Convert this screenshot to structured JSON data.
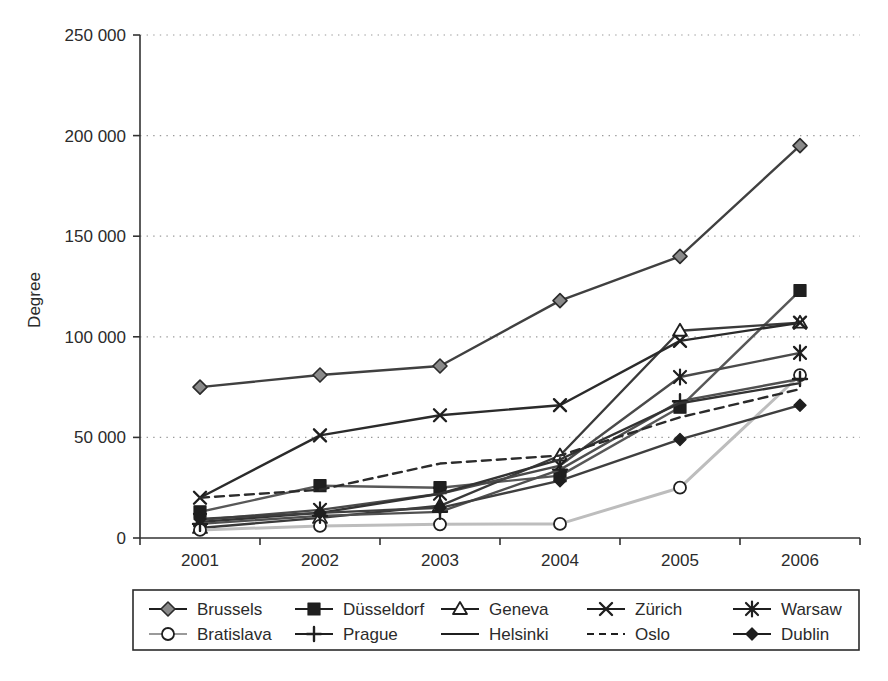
{
  "chart_data": {
    "type": "line",
    "title": "",
    "xlabel": "",
    "ylabel": "Degree",
    "categories": [
      "2001",
      "2002",
      "2003",
      "2004",
      "2005",
      "2006"
    ],
    "x": [
      2001,
      2002,
      2003,
      2004,
      2005,
      2006
    ],
    "ylim": [
      0,
      250000
    ],
    "ytick_values": [
      0,
      50000,
      100000,
      150000,
      200000,
      250000
    ],
    "ytick_labels": [
      "0",
      "50 000",
      "100 000",
      "150 000",
      "200 000",
      "250 000"
    ],
    "grid": "horizontal-dotted",
    "legend_position": "bottom",
    "series": [
      {
        "name": "Brussels",
        "marker": "diamond-filled-gray",
        "line_style": "solid",
        "color": "#404040",
        "values": [
          75000,
          81000,
          85500,
          118000,
          140000,
          195000
        ]
      },
      {
        "name": "Düsseldorf",
        "marker": "square-filled",
        "line_style": "solid",
        "color": "#585858",
        "values": [
          13000,
          26000,
          25000,
          31000,
          65000,
          123000
        ]
      },
      {
        "name": "Geneva",
        "marker": "triangle-open",
        "line_style": "solid",
        "color": "#3a3a3a",
        "values": [
          5000,
          10000,
          16000,
          41000,
          103000,
          107000
        ]
      },
      {
        "name": "Zürich",
        "marker": "cross-x",
        "line_style": "solid",
        "color": "#2b2b2b",
        "values": [
          20000,
          51000,
          61000,
          66000,
          98000,
          107000
        ]
      },
      {
        "name": "Warsaw",
        "marker": "asterisk",
        "line_style": "solid",
        "color": "#4a4a4a",
        "values": [
          9000,
          14000,
          22000,
          36000,
          80000,
          92000
        ]
      },
      {
        "name": "Bratislava",
        "marker": "circle-open",
        "line_style": "solid",
        "color": "#bdbdbd",
        "values": [
          4000,
          6000,
          6800,
          7000,
          25000,
          81000
        ]
      },
      {
        "name": "Prague",
        "marker": "plus",
        "line_style": "solid",
        "color": "#505050",
        "values": [
          7000,
          11000,
          13000,
          34000,
          68000,
          79000
        ]
      },
      {
        "name": "Helsinki",
        "marker": "none",
        "line_style": "solid",
        "color": "#333333",
        "values": [
          8000,
          12500,
          22000,
          39000,
          67000,
          77000
        ]
      },
      {
        "name": "Oslo",
        "marker": "none",
        "line_style": "dashed",
        "color": "#2b2b2b",
        "values": [
          20000,
          24000,
          37000,
          41000,
          60000,
          74000
        ]
      },
      {
        "name": "Dublin",
        "marker": "diamond-filled",
        "line_style": "solid",
        "color": "#3f3f3f",
        "values": [
          9500,
          12500,
          15000,
          28500,
          49000,
          66000
        ]
      }
    ]
  },
  "legend": {
    "rows": [
      [
        "Brussels",
        "Düsseldorf",
        "Geneva",
        "Zürich",
        "Warsaw"
      ],
      [
        "Bratislava",
        "Prague",
        "Helsinki",
        "Oslo",
        "Dublin"
      ]
    ]
  }
}
